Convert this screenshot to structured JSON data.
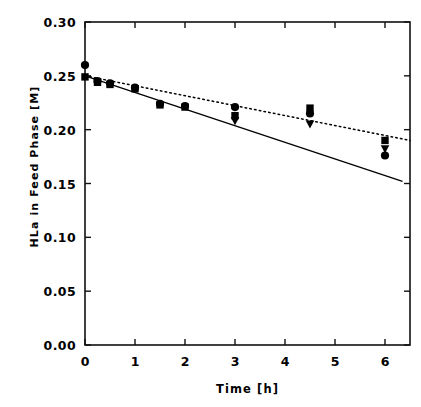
{
  "chart_data": {
    "type": "scatter",
    "title": "",
    "xlabel": "Time [h]",
    "ylabel": "HLa in Feed Phase [M]",
    "xlim": [
      0,
      6.5
    ],
    "ylim": [
      0.0,
      0.3
    ],
    "xticks": [
      0,
      1,
      2,
      3,
      4,
      5,
      6
    ],
    "yticks": [
      0.0,
      0.05,
      0.1,
      0.15,
      0.2,
      0.25,
      0.3
    ],
    "xticklabels": [
      "0",
      "1",
      "2",
      "3",
      "4",
      "5",
      "6"
    ],
    "yticklabels": [
      "0.00",
      "0.05",
      "0.10",
      "0.15",
      "0.20",
      "0.25",
      "0.30"
    ],
    "grid": false,
    "legend": "none",
    "frame": "box",
    "tick_direction": "in",
    "series": [
      {
        "name": "circle-series",
        "marker": "circle",
        "color": "#000000",
        "x": [
          0.0,
          0.25,
          0.5,
          1.0,
          1.5,
          2.0,
          3.0,
          4.5,
          6.0
        ],
        "y": [
          0.26,
          0.245,
          0.243,
          0.239,
          0.224,
          0.222,
          0.221,
          0.215,
          0.176
        ]
      },
      {
        "name": "square-series",
        "marker": "square",
        "color": "#000000",
        "x": [
          0.0,
          0.25,
          0.5,
          1.0,
          1.5,
          2.0,
          3.0,
          4.5,
          6.0
        ],
        "y": [
          0.249,
          0.244,
          0.242,
          0.238,
          0.223,
          0.221,
          0.213,
          0.22,
          0.19
        ]
      },
      {
        "name": "triangle-series",
        "marker": "triangle-down",
        "color": "#000000",
        "x": [
          3.0,
          4.5,
          6.0
        ],
        "y": [
          0.208,
          0.205,
          0.182
        ]
      }
    ],
    "lines": [
      {
        "name": "dotted-fit-line",
        "style": "dotted",
        "color": "#000000",
        "x": [
          0.0,
          6.5
        ],
        "y": [
          0.25,
          0.19
        ]
      },
      {
        "name": "solid-fit-line",
        "style": "solid",
        "color": "#000000",
        "x": [
          0.0,
          6.35
        ],
        "y": [
          0.25,
          0.152
        ]
      }
    ]
  }
}
